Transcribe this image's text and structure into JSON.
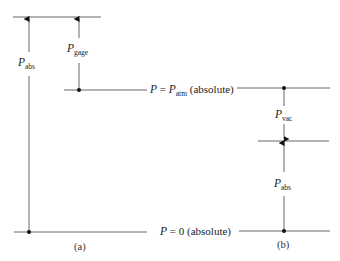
{
  "figure": {
    "levels": {
      "atm": {
        "label_var": "P",
        "label_eq": " = ",
        "label_sym": "P",
        "label_sub": "atm",
        "label_suffix": " (absolute)"
      },
      "zero": {
        "label_var": "P",
        "label_eq": " = 0",
        "label_suffix": " (absolute)"
      }
    },
    "panel_a": {
      "caption": "(a)",
      "arrows": [
        {
          "sym": "P",
          "sub": "abs"
        },
        {
          "sym": "P",
          "sub": "gage"
        }
      ]
    },
    "panel_b": {
      "caption": "(b)",
      "arrows": [
        {
          "sym": "P",
          "sub": "vac"
        },
        {
          "sym": "P",
          "sub": "abs"
        }
      ]
    },
    "colors": {
      "line": "#555555",
      "dot": "#111111",
      "text": "#222222"
    }
  }
}
